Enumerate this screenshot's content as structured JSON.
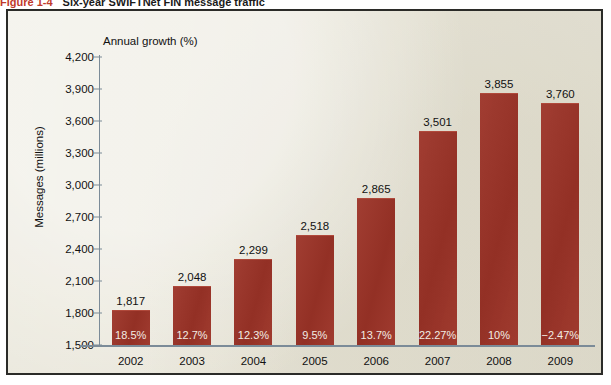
{
  "figure": {
    "number": "Figure 1-4",
    "caption": "Six-year SWIFTNet FIN message traffic"
  },
  "colors": {
    "bar": "#9c3327",
    "panel_background": "#e9e6d9",
    "frame_border": "#2b2b28",
    "axis_line": "#7b8b98",
    "text": "#111111",
    "bar_label_text": "#f2ece3",
    "figure_number": "#c0392b"
  },
  "chart_data": {
    "type": "bar",
    "title": "Six-year SWIFTNet FIN message traffic",
    "xlabel": "",
    "ylabel": "Messages (millions)",
    "secondary_label": "Annual growth (%)",
    "categories": [
      "2002",
      "2003",
      "2004",
      "2005",
      "2006",
      "2007",
      "2008",
      "2009"
    ],
    "values": [
      1817,
      2048,
      2299,
      2518,
      2865,
      3501,
      3855,
      3760
    ],
    "value_labels": [
      "1,817",
      "2,048",
      "2,299",
      "2,518",
      "2,865",
      "3,501",
      "3,855",
      "3,760"
    ],
    "growth_labels": [
      "18.5%",
      "12.7%",
      "12.3%",
      "9.5%",
      "13.7%",
      "22.27%",
      "10%",
      "−2.47%"
    ],
    "growth_values": [
      18.5,
      12.7,
      12.3,
      9.5,
      13.7,
      22.27,
      10,
      -2.47
    ],
    "ylim": [
      1500,
      4200
    ],
    "yticks": [
      1500,
      1800,
      2100,
      2400,
      2700,
      3000,
      3300,
      3600,
      3900,
      4200
    ],
    "ytick_labels": [
      "1,500",
      "1,800",
      "2,100",
      "2,400",
      "2,700",
      "3,000",
      "3,300",
      "3,600",
      "3,900",
      "4,200"
    ],
    "grid": false,
    "legend": "none"
  }
}
